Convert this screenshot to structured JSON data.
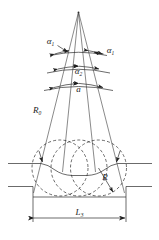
{
  "figure": {
    "type": "engineering-diagram",
    "title": "",
    "background_color": "#ffffff",
    "line_color": "#2b2b2b",
    "labels": {
      "angle_outer_left": {
        "base": "α",
        "sub": "1"
      },
      "angle_outer_right": {
        "base": "α",
        "sub": "1"
      },
      "angle_middle": {
        "base": "α",
        "sub": "2"
      },
      "angle_inner": {
        "base": "a",
        "sub": ""
      },
      "radius_long": {
        "base": "R",
        "sub": "0"
      },
      "radius_circle": {
        "base": "R",
        "sub": ""
      },
      "length_dim": {
        "base": "L",
        "sub": "3"
      }
    },
    "elements": {
      "apex": "ray-apex",
      "rays": 4,
      "angle_arcs": 3,
      "circles": 3,
      "circle_style": "dashed",
      "dimension_line": "horizontal-double-arrow"
    }
  }
}
